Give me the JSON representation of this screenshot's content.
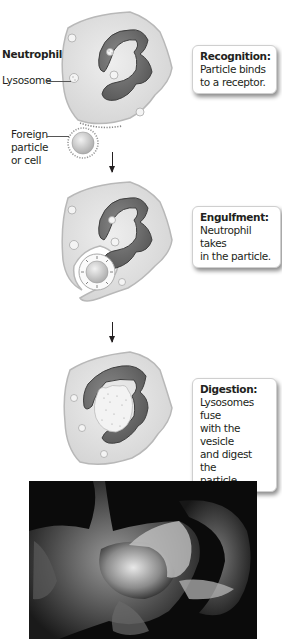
{
  "figure": {
    "top_caption_cut": "Phagocytosis overview",
    "labels": {
      "neutrophil": "Neutrophil",
      "lysosome": "Lysosome",
      "foreign_line1": "Foreign",
      "foreign_line2": "particle",
      "foreign_line3": "or cell"
    },
    "steps": [
      {
        "title": "Recognition:",
        "body_lines": [
          "Particle binds",
          "to a receptor."
        ]
      },
      {
        "title": "Engulfment:",
        "body_lines": [
          "Neutrophil takes",
          "in the particle."
        ]
      },
      {
        "title": "Digestion:",
        "body_lines": [
          "Lysosomes fuse",
          "with the vesicle",
          "and digest the",
          "particle."
        ]
      }
    ],
    "micrograph": {
      "description": "scanning electron micrograph of neutrophil engulfing particle"
    },
    "colors": {
      "cell_fill": "#e4e4e4",
      "cell_edge": "#b8b8b8",
      "nucleus": "#6f6f6f",
      "nucleus_dark": "#4a4a4a",
      "background": "#ffffff"
    }
  }
}
